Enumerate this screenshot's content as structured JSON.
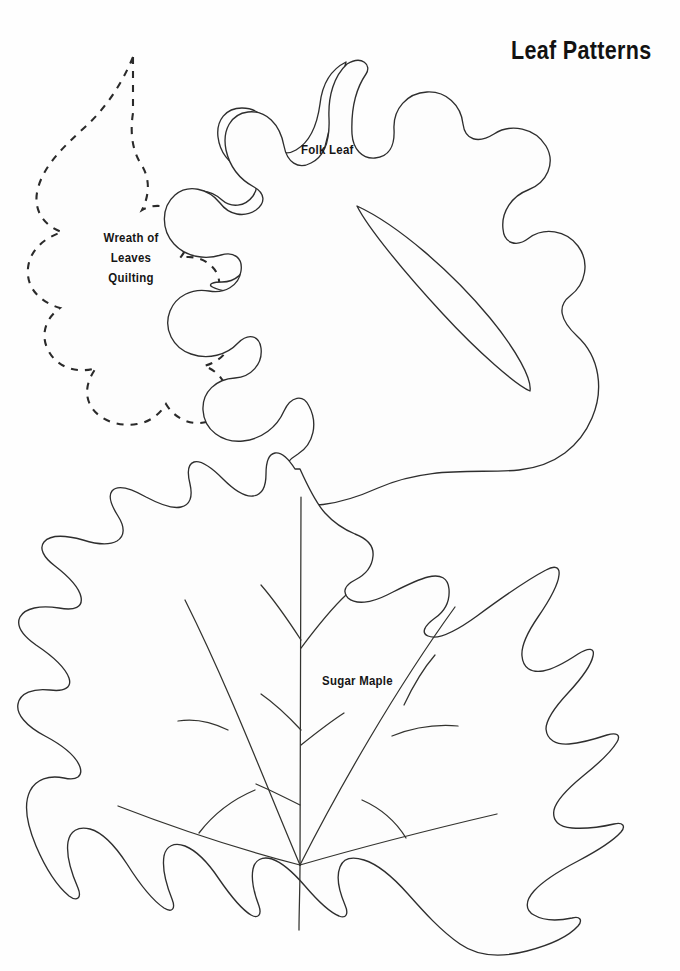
{
  "document": {
    "title": "Leaf Patterns",
    "background_color": "#fefefe",
    "ink_color": "#2e2e2e",
    "width": 680,
    "height": 971,
    "kind": "printable craft pattern sheet"
  },
  "labels": {
    "wreath": "Wreath of\nLeaves\nQuilting",
    "wreath_line1": "Wreath of",
    "wreath_line2": "Leaves",
    "wreath_line3": "Quilting",
    "folk": "Folk Leaf",
    "maple": "Sugar Maple"
  },
  "patterns": [
    {
      "name": "wreath-of-leaves-quilting-leaf",
      "label": "Wreath of Leaves Quilting",
      "outline_style": "dashed",
      "has_veins": false,
      "has_inner_cutout": false,
      "position": "upper-left"
    },
    {
      "name": "folk-leaf",
      "label": "Folk Leaf",
      "outline_style": "solid",
      "has_veins": false,
      "has_inner_cutout": true,
      "position": "upper-right"
    },
    {
      "name": "sugar-maple-leaf",
      "label": "Sugar Maple",
      "outline_style": "solid",
      "has_veins": true,
      "has_inner_cutout": false,
      "position": "bottom-center"
    }
  ]
}
